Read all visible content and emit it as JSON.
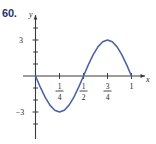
{
  "figure": {
    "problem_number": "60.",
    "number_color": "#28356b",
    "curve_color": "#4a5fa5",
    "axis_color": "#3a3a3a",
    "background": "#ffffff"
  },
  "axes": {
    "x_axis_label": "x",
    "y_axis_label": "y",
    "x_ticks": [
      {
        "value": 0.25,
        "label_num": "1",
        "label_den": "4"
      },
      {
        "value": 0.5,
        "label_num": "1",
        "label_den": "2"
      },
      {
        "value": 0.75,
        "label_num": "3",
        "label_den": "4"
      },
      {
        "value": 1.0,
        "label": "1"
      }
    ],
    "y_ticks": [
      {
        "value": 3,
        "label": "3"
      },
      {
        "value": 2,
        "label": ""
      },
      {
        "value": 1,
        "label": ""
      },
      {
        "value": -1,
        "label": ""
      },
      {
        "value": -2,
        "label": ""
      },
      {
        "value": -3,
        "label": "−3"
      }
    ]
  },
  "chart_data": {
    "type": "line",
    "title": "",
    "xlabel": "x",
    "ylabel": "y",
    "xlim": [
      -0.04,
      1.18
    ],
    "ylim": [
      -5.2,
      5.2
    ],
    "grid": false,
    "legend": null,
    "annotations": [],
    "series": [
      {
        "name": "y = -3 sin(4πx)",
        "amplitude": 3,
        "period": 0.5,
        "x_start": 0,
        "x_end": 1,
        "key_points": [
          {
            "x": 0.0,
            "y": 0
          },
          {
            "x": 0.125,
            "y": -3
          },
          {
            "x": 0.25,
            "y": 0
          },
          {
            "x": 0.375,
            "y": 3
          },
          {
            "x": 0.5,
            "y": 0
          },
          {
            "x": 0.625,
            "y": -3
          },
          {
            "x": 0.75,
            "y": 0
          },
          {
            "x": 0.875,
            "y": 3
          },
          {
            "x": 1.0,
            "y": 0
          }
        ],
        "x": [
          0,
          0.025,
          0.05,
          0.075,
          0.1,
          0.125,
          0.15,
          0.175,
          0.2,
          0.225,
          0.25,
          0.275,
          0.3,
          0.325,
          0.35,
          0.375,
          0.4,
          0.425,
          0.45,
          0.475,
          0.5,
          0.525,
          0.55,
          0.575,
          0.6,
          0.625,
          0.65,
          0.675,
          0.7,
          0.725,
          0.75,
          0.775,
          0.8,
          0.825,
          0.85,
          0.875,
          0.9,
          0.925,
          0.95,
          0.975,
          1.0
        ],
        "y": [
          0,
          -1.147,
          -2.163,
          -2.853,
          -3,
          -2.853,
          -2.163,
          -1.147,
          0,
          1.147,
          2.163,
          2.853,
          3,
          2.853,
          2.163,
          1.147,
          0,
          -1.147,
          -2.163,
          -2.853,
          -3,
          -2.853,
          -2.163,
          -1.147,
          0,
          1.147,
          2.163,
          2.853,
          3,
          2.853,
          2.163,
          1.147,
          0,
          -1.147,
          -2.163,
          -2.853,
          -3,
          -2.853,
          -2.163,
          -1.147,
          0
        ]
      }
    ],
    "drawn_shape_note": "one full sine cycle of amplitude 3 over x in [0,1]: down to -3 near x=1/8..1/4, up through 0 at x=1/2, peak +3 near x=3/4, back to 0 at x=1",
    "visual_x": [
      0,
      0.05,
      0.1,
      0.15,
      0.2,
      0.25,
      0.3,
      0.35,
      0.4,
      0.45,
      0.5,
      0.55,
      0.6,
      0.65,
      0.7,
      0.75,
      0.8,
      0.85,
      0.9,
      0.95,
      1.0
    ],
    "visual_y": [
      0,
      -0.927,
      -1.763,
      -2.427,
      -2.853,
      -3,
      -2.853,
      -2.427,
      -1.763,
      -0.927,
      0,
      0.927,
      1.763,
      2.427,
      2.853,
      3,
      2.853,
      2.427,
      1.763,
      0.927,
      0
    ]
  }
}
